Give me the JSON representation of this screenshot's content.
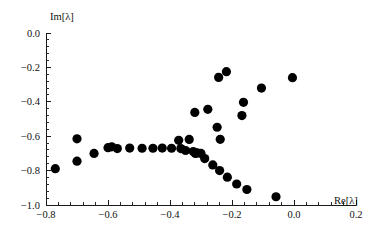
{
  "chart_data": {
    "type": "scatter",
    "title": "",
    "subtitle": "",
    "xlabel": "Re[λ]",
    "ylabel": "Im[λ]",
    "xlim": [
      -0.8,
      0.2
    ],
    "ylim": [
      -1.0,
      0.0
    ],
    "xticks": [
      -0.8,
      -0.6,
      -0.4,
      -0.2,
      0.0,
      0.2
    ],
    "xticklabels": [
      "-0.8",
      "-0.6",
      "-0.4",
      "-0.2",
      "0.0",
      "0.2"
    ],
    "yticks": [
      -1.0,
      -0.8,
      -0.6,
      -0.4,
      -0.2,
      0.0
    ],
    "yticklabels": [
      "-1.0",
      "-0.8",
      "-0.6",
      "-0.4",
      "-0.2",
      "0.0"
    ],
    "minor_ticks_per_interval": 4,
    "grid": false,
    "legend": null,
    "legend_position": "none",
    "marker": "circle",
    "marker_color": "#000000",
    "marker_size": 4.6,
    "series": [
      {
        "name": "eigenvalues",
        "points": [
          [
            -0.77,
            -0.789
          ],
          [
            -0.7,
            -0.615
          ],
          [
            -0.7,
            -0.745
          ],
          [
            -0.645,
            -0.7
          ],
          [
            -0.6,
            -0.667
          ],
          [
            -0.588,
            -0.662
          ],
          [
            -0.57,
            -0.672
          ],
          [
            -0.53,
            -0.669
          ],
          [
            -0.49,
            -0.67
          ],
          [
            -0.455,
            -0.67
          ],
          [
            -0.425,
            -0.669
          ],
          [
            -0.395,
            -0.67
          ],
          [
            -0.365,
            -0.672
          ],
          [
            -0.372,
            -0.624
          ],
          [
            -0.35,
            -0.683
          ],
          [
            -0.338,
            -0.619
          ],
          [
            -0.325,
            -0.689
          ],
          [
            -0.318,
            -0.7
          ],
          [
            -0.32,
            -0.462
          ],
          [
            -0.312,
            -0.697
          ],
          [
            -0.3,
            -0.7
          ],
          [
            -0.288,
            -0.73
          ],
          [
            -0.278,
            -0.444
          ],
          [
            -0.262,
            -0.767
          ],
          [
            -0.248,
            -0.548
          ],
          [
            -0.243,
            -0.258
          ],
          [
            -0.24,
            -0.8
          ],
          [
            -0.238,
            -0.618
          ],
          [
            -0.218,
            -0.225
          ],
          [
            -0.215,
            -0.838
          ],
          [
            -0.185,
            -0.878
          ],
          [
            -0.168,
            -0.48
          ],
          [
            -0.163,
            -0.403
          ],
          [
            -0.152,
            -0.91
          ],
          [
            -0.105,
            -0.32
          ],
          [
            -0.058,
            -0.952
          ],
          [
            -0.005,
            -0.26
          ]
        ]
      }
    ]
  },
  "axes": {
    "x_axis_name": "x-axis",
    "y_axis_name": "y-axis"
  }
}
